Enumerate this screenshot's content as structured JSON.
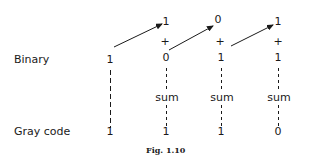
{
  "labels": {
    "binary": "Binary",
    "gray_code": "Gray code",
    "sum": "sum",
    "plus": "+"
  },
  "binary_bits": [
    "1",
    "0",
    "1",
    "1"
  ],
  "shifted_bits": [
    "1",
    "0",
    "1"
  ],
  "gray_bits": [
    "1",
    "1",
    "1",
    "0"
  ],
  "caption": "Fig. 1.10"
}
